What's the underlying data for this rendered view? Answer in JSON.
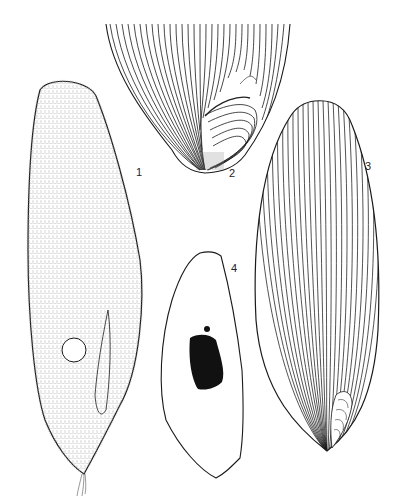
{
  "figure": {
    "panels": [
      {
        "id": "1",
        "label": "1",
        "description": "Ciliate cell, stippled body with cilia, contractile vacuole and caudal tuft"
      },
      {
        "id": "2",
        "label": "2",
        "description": "Posterior end of cell showing kinety lines converging to oral region"
      },
      {
        "id": "3",
        "label": "3",
        "description": "Whole cell showing longitudinal kinety lines"
      },
      {
        "id": "4",
        "label": "4",
        "description": "Cell outline with macronucleus and micronucleus"
      }
    ]
  },
  "colors": {
    "ink": "#1a1a1a",
    "background": "#ffffff",
    "nucleus": "#111111"
  }
}
